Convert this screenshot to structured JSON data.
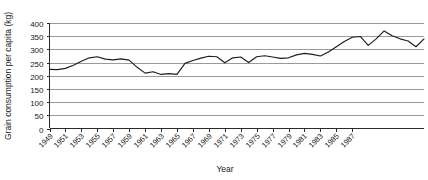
{
  "chart_data": {
    "type": "line",
    "title": "",
    "xlabel": "Year",
    "ylabel": "Grain consumption per capita (kg)",
    "ylim": [
      0,
      400
    ],
    "xlim": [
      1949,
      1988
    ],
    "grid": true,
    "legend": "none",
    "y_ticks": [
      0,
      50,
      100,
      150,
      200,
      250,
      300,
      350,
      400
    ],
    "y_tick_labels": [
      "0",
      "50",
      "100",
      "150",
      "200",
      "250",
      "300",
      "350",
      "400"
    ],
    "x_tick_labels": [
      "1949",
      "1951",
      "1953",
      "1955",
      "1957",
      "1959",
      "1961",
      "1963",
      "1965",
      "1967",
      "1969",
      "1971",
      "1973",
      "1975",
      "1977",
      "1979",
      "1981",
      "1983",
      "1985",
      "1987"
    ],
    "x": [
      1949,
      1950,
      1951,
      1952,
      1953,
      1954,
      1955,
      1956,
      1957,
      1958,
      1959,
      1960,
      1961,
      1962,
      1963,
      1964,
      1965,
      1966,
      1967,
      1968,
      1969,
      1970,
      1971,
      1972,
      1973,
      1974,
      1975,
      1976,
      1977,
      1978,
      1979,
      1980,
      1981,
      1982,
      1983,
      1984,
      1985,
      1986,
      1987
    ],
    "series": [
      {
        "name": "Grain consumption per capita",
        "color": "#1d1d1d",
        "values": [
          224,
          223,
          228,
          240,
          255,
          268,
          272,
          263,
          260,
          264,
          259,
          232,
          210,
          215,
          205,
          208,
          205,
          247,
          258,
          267,
          274,
          272,
          249,
          268,
          271,
          250,
          272,
          276,
          271,
          266,
          268,
          279,
          285,
          281,
          275,
          290,
          310,
          330,
          346
        ]
      }
    ],
    "annotations": []
  },
  "chart_data_extended": {
    "series_full": {
      "name": "Grain consumption per capita",
      "points": [
        {
          "year": 1949,
          "value": 224
        },
        {
          "year": 1950,
          "value": 223
        },
        {
          "year": 1951,
          "value": 228
        },
        {
          "year": 1952,
          "value": 240
        },
        {
          "year": 1953,
          "value": 255
        },
        {
          "year": 1954,
          "value": 268
        },
        {
          "year": 1955,
          "value": 272
        },
        {
          "year": 1956,
          "value": 263
        },
        {
          "year": 1957,
          "value": 260
        },
        {
          "year": 1958,
          "value": 264
        },
        {
          "year": 1959,
          "value": 259
        },
        {
          "year": 1960,
          "value": 232
        },
        {
          "year": 1961,
          "value": 210
        },
        {
          "year": 1962,
          "value": 215
        },
        {
          "year": 1963,
          "value": 205
        },
        {
          "year": 1964,
          "value": 208
        },
        {
          "year": 1965,
          "value": 205
        },
        {
          "year": 1966,
          "value": 247
        },
        {
          "year": 1967,
          "value": 258
        },
        {
          "year": 1968,
          "value": 267
        },
        {
          "year": 1969,
          "value": 274
        },
        {
          "year": 1970,
          "value": 272
        },
        {
          "year": 1971,
          "value": 249
        },
        {
          "year": 1972,
          "value": 268
        },
        {
          "year": 1973,
          "value": 271
        },
        {
          "year": 1974,
          "value": 250
        },
        {
          "year": 1975,
          "value": 272
        },
        {
          "year": 1976,
          "value": 276
        },
        {
          "year": 1977,
          "value": 271
        },
        {
          "year": 1978,
          "value": 266
        },
        {
          "year": 1979,
          "value": 268
        },
        {
          "year": 1980,
          "value": 279
        },
        {
          "year": 1981,
          "value": 285
        },
        {
          "year": 1982,
          "value": 281
        },
        {
          "year": 1983,
          "value": 275
        },
        {
          "year": 1984,
          "value": 290
        },
        {
          "year": 1985,
          "value": 310
        },
        {
          "year": 1986,
          "value": 330
        },
        {
          "year": 1987,
          "value": 346
        },
        {
          "year": 1988,
          "value": 349
        },
        {
          "year": 1989,
          "value": 315
        },
        {
          "year": 1990,
          "value": 340
        },
        {
          "year": 1991,
          "value": 370
        },
        {
          "year": 1992,
          "value": 352
        },
        {
          "year": 1993,
          "value": 340
        },
        {
          "year": 1994,
          "value": 332
        },
        {
          "year": 1995,
          "value": 310
        },
        {
          "year": 1996,
          "value": 340
        }
      ]
    }
  },
  "plot": {
    "line_color": "#1d1d1d",
    "grid_color": "#9a9a9a",
    "axis_color": "#2b2b2b",
    "background": "#ffffff"
  }
}
